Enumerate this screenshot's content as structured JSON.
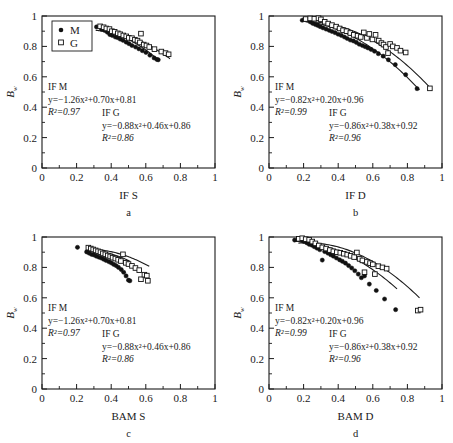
{
  "figure": {
    "y_axis_label_main": "B",
    "y_axis_label_sub": "w",
    "legend": {
      "items": [
        {
          "key": "M",
          "marker": "filled-circle"
        },
        {
          "key": "G",
          "marker": "open-square"
        }
      ]
    },
    "axis_ticks": {
      "x": [
        "0",
        "0.2",
        "0.4",
        "0.6",
        "0.8",
        "1"
      ],
      "y": [
        "0",
        "0.2",
        "0.4",
        "0.6",
        "0.8",
        "1"
      ]
    }
  },
  "chart_data": [
    {
      "type": "scatter",
      "panel": "a",
      "caption": "a",
      "xlabel": "IF S",
      "ylabel": "Bw",
      "xlim": [
        0,
        1
      ],
      "ylim": [
        0,
        1
      ],
      "grid": false,
      "legend_position": "top-left",
      "annotations": [
        {
          "title": "IF M",
          "equation": "y=−1.26x²+0.70x+0.81",
          "r2": "R²=0.97"
        },
        {
          "title": "IF G",
          "equation": "y=−0.88x²+0.46x+0.86",
          "r2": "R²=0.86"
        }
      ],
      "series": [
        {
          "name": "M",
          "marker": "filled-circle",
          "fit": {
            "a": -1.26,
            "b": 0.7,
            "c": 0.81,
            "r2": 0.97,
            "xstart": 0.31,
            "xend": 0.67
          },
          "points": [
            [
              0.315,
              0.928
            ],
            [
              0.345,
              0.912
            ],
            [
              0.362,
              0.905
            ],
            [
              0.378,
              0.893
            ],
            [
              0.392,
              0.878
            ],
            [
              0.406,
              0.872
            ],
            [
              0.424,
              0.862
            ],
            [
              0.437,
              0.858
            ],
            [
              0.452,
              0.848
            ],
            [
              0.468,
              0.84
            ],
            [
              0.487,
              0.828
            ],
            [
              0.503,
              0.818
            ],
            [
              0.52,
              0.806
            ],
            [
              0.541,
              0.796
            ],
            [
              0.56,
              0.784
            ],
            [
              0.58,
              0.772
            ],
            [
              0.601,
              0.76
            ],
            [
              0.624,
              0.742
            ],
            [
              0.648,
              0.724
            ],
            [
              0.664,
              0.714
            ],
            [
              0.672,
              0.712
            ]
          ]
        },
        {
          "name": "G",
          "marker": "open-square",
          "fit": {
            "a": -0.88,
            "b": 0.46,
            "c": 0.86,
            "r2": 0.86,
            "xstart": 0.33,
            "xend": 0.74
          },
          "points": [
            [
              0.336,
              0.932
            ],
            [
              0.356,
              0.926
            ],
            [
              0.372,
              0.918
            ],
            [
              0.39,
              0.914
            ],
            [
              0.404,
              0.9
            ],
            [
              0.42,
              0.896
            ],
            [
              0.438,
              0.886
            ],
            [
              0.452,
              0.88
            ],
            [
              0.47,
              0.872
            ],
            [
              0.487,
              0.866
            ],
            [
              0.502,
              0.856
            ],
            [
              0.52,
              0.854
            ],
            [
              0.537,
              0.844
            ],
            [
              0.552,
              0.838
            ],
            [
              0.566,
              0.826
            ],
            [
              0.572,
              0.884
            ],
            [
              0.588,
              0.812
            ],
            [
              0.604,
              0.806
            ],
            [
              0.62,
              0.796
            ],
            [
              0.65,
              0.782
            ],
            [
              0.69,
              0.766
            ],
            [
              0.714,
              0.756
            ],
            [
              0.732,
              0.748
            ]
          ]
        }
      ]
    },
    {
      "type": "scatter",
      "panel": "b",
      "caption": "b",
      "xlabel": "IF D",
      "ylabel": "Bw",
      "xlim": [
        0,
        1
      ],
      "ylim": [
        0,
        1
      ],
      "grid": false,
      "legend_position": "none",
      "annotations": [
        {
          "title": "IF M",
          "equation": "y=−0.82x²+0.20x+0.96",
          "r2": "R²=0.99"
        },
        {
          "title": "IF G",
          "equation": "y=−0.86x²+0.38x+0.92",
          "r2": "R²=0.96"
        }
      ],
      "series": [
        {
          "name": "M",
          "marker": "filled-circle",
          "fit": {
            "a": -0.82,
            "b": 0.2,
            "c": 0.96,
            "r2": 0.99,
            "xstart": 0.19,
            "xend": 0.87
          },
          "points": [
            [
              0.192,
              0.972
            ],
            [
              0.205,
              0.978
            ],
            [
              0.222,
              0.972
            ],
            [
              0.238,
              0.962
            ],
            [
              0.252,
              0.952
            ],
            [
              0.268,
              0.944
            ],
            [
              0.282,
              0.938
            ],
            [
              0.296,
              0.93
            ],
            [
              0.312,
              0.922
            ],
            [
              0.33,
              0.914
            ],
            [
              0.348,
              0.906
            ],
            [
              0.364,
              0.898
            ],
            [
              0.382,
              0.89
            ],
            [
              0.4,
              0.88
            ],
            [
              0.418,
              0.872
            ],
            [
              0.436,
              0.862
            ],
            [
              0.452,
              0.852
            ],
            [
              0.47,
              0.842
            ],
            [
              0.488,
              0.836
            ],
            [
              0.505,
              0.826
            ],
            [
              0.522,
              0.814
            ],
            [
              0.54,
              0.806
            ],
            [
              0.556,
              0.798
            ],
            [
              0.572,
              0.79
            ],
            [
              0.59,
              0.78
            ],
            [
              0.61,
              0.768
            ],
            [
              0.632,
              0.752
            ],
            [
              0.66,
              0.736
            ],
            [
              0.69,
              0.712
            ],
            [
              0.73,
              0.68
            ],
            [
              0.79,
              0.614
            ],
            [
              0.856,
              0.522
            ]
          ]
        },
        {
          "name": "G",
          "marker": "open-square",
          "fit": {
            "a": -0.86,
            "b": 0.38,
            "c": 0.92,
            "r2": 0.96,
            "xstart": 0.21,
            "xend": 0.94
          },
          "points": [
            [
              0.212,
              0.98
            ],
            [
              0.238,
              0.984
            ],
            [
              0.262,
              0.982
            ],
            [
              0.286,
              0.986
            ],
            [
              0.3,
              0.978
            ],
            [
              0.322,
              0.962
            ],
            [
              0.342,
              0.95
            ],
            [
              0.364,
              0.94
            ],
            [
              0.388,
              0.93
            ],
            [
              0.408,
              0.918
            ],
            [
              0.428,
              0.906
            ],
            [
              0.448,
              0.9
            ],
            [
              0.47,
              0.888
            ],
            [
              0.49,
              0.876
            ],
            [
              0.512,
              0.87
            ],
            [
              0.53,
              0.862
            ],
            [
              0.548,
              0.892
            ],
            [
              0.566,
              0.856
            ],
            [
              0.58,
              0.882
            ],
            [
              0.598,
              0.846
            ],
            [
              0.616,
              0.876
            ],
            [
              0.634,
              0.838
            ],
            [
              0.65,
              0.822
            ],
            [
              0.662,
              0.812
            ],
            [
              0.676,
              0.796
            ],
            [
              0.688,
              0.756
            ],
            [
              0.7,
              0.816
            ],
            [
              0.716,
              0.8
            ],
            [
              0.74,
              0.79
            ],
            [
              0.76,
              0.772
            ],
            [
              0.79,
              0.76
            ],
            [
              0.93,
              0.524
            ]
          ]
        }
      ]
    },
    {
      "type": "scatter",
      "panel": "c",
      "caption": "c",
      "xlabel": "BAM S",
      "ylabel": "Bw",
      "xlim": [
        0,
        1
      ],
      "ylim": [
        0,
        1
      ],
      "grid": false,
      "legend_position": "none",
      "annotations": [
        {
          "title": "IF M",
          "equation": "y=−1.26x²+0.70x+0.81",
          "r2": "R²=0.97"
        },
        {
          "title": "IF G",
          "equation": "y=−0.88x²+0.46x+0.86",
          "r2": "R²=0.86"
        }
      ],
      "series": [
        {
          "name": "M",
          "marker": "filled-circle",
          "fit": {
            "a": -1.26,
            "b": 0.7,
            "c": 0.81,
            "r2": 0.97,
            "xstart": 0.25,
            "xend": 0.51
          },
          "points": [
            [
              0.205,
              0.932
            ],
            [
              0.258,
              0.902
            ],
            [
              0.272,
              0.894
            ],
            [
              0.286,
              0.886
            ],
            [
              0.3,
              0.882
            ],
            [
              0.314,
              0.874
            ],
            [
              0.328,
              0.868
            ],
            [
              0.342,
              0.862
            ],
            [
              0.356,
              0.854
            ],
            [
              0.37,
              0.846
            ],
            [
              0.386,
              0.838
            ],
            [
              0.4,
              0.83
            ],
            [
              0.414,
              0.82
            ],
            [
              0.428,
              0.812
            ],
            [
              0.442,
              0.8
            ],
            [
              0.458,
              0.786
            ],
            [
              0.472,
              0.768
            ],
            [
              0.486,
              0.744
            ],
            [
              0.5,
              0.716
            ],
            [
              0.508,
              0.712
            ]
          ]
        },
        {
          "name": "G",
          "marker": "open-square",
          "fit": {
            "a": -0.88,
            "b": 0.46,
            "c": 0.86,
            "r2": 0.86,
            "xstart": 0.27,
            "xend": 0.62
          },
          "points": [
            [
              0.268,
              0.93
            ],
            [
              0.282,
              0.924
            ],
            [
              0.296,
              0.918
            ],
            [
              0.31,
              0.912
            ],
            [
              0.324,
              0.906
            ],
            [
              0.338,
              0.9
            ],
            [
              0.352,
              0.892
            ],
            [
              0.366,
              0.886
            ],
            [
              0.38,
              0.878
            ],
            [
              0.394,
              0.872
            ],
            [
              0.408,
              0.864
            ],
            [
              0.424,
              0.858
            ],
            [
              0.44,
              0.85
            ],
            [
              0.456,
              0.842
            ],
            [
              0.468,
              0.886
            ],
            [
              0.484,
              0.83
            ],
            [
              0.5,
              0.822
            ],
            [
              0.52,
              0.81
            ],
            [
              0.54,
              0.796
            ],
            [
              0.562,
              0.782
            ],
            [
              0.572,
              0.722
            ],
            [
              0.592,
              0.752
            ],
            [
              0.606,
              0.746
            ],
            [
              0.612,
              0.712
            ]
          ]
        }
      ]
    },
    {
      "type": "scatter",
      "panel": "d",
      "caption": "d",
      "xlabel": "BAM D",
      "ylabel": "Bw",
      "xlim": [
        0,
        1
      ],
      "ylim": [
        0,
        1
      ],
      "grid": false,
      "legend_position": "none",
      "annotations": [
        {
          "title": "IF M",
          "equation": "y=−0.82x²+0.20x+0.96",
          "r2": "R²=0.99"
        },
        {
          "title": "IF G",
          "equation": "y=−0.86x²+0.38x+0.92",
          "r2": "R²=0.96"
        }
      ],
      "series": [
        {
          "name": "M",
          "marker": "filled-circle",
          "fit": {
            "a": -0.82,
            "b": 0.2,
            "c": 0.96,
            "r2": 0.99,
            "xstart": 0.15,
            "xend": 0.74
          },
          "points": [
            [
              0.148,
              0.98
            ],
            [
              0.168,
              0.984
            ],
            [
              0.186,
              0.978
            ],
            [
              0.202,
              0.97
            ],
            [
              0.218,
              0.962
            ],
            [
              0.232,
              0.952
            ],
            [
              0.248,
              0.946
            ],
            [
              0.262,
              0.936
            ],
            [
              0.278,
              0.926
            ],
            [
              0.294,
              0.916
            ],
            [
              0.308,
              0.848
            ],
            [
              0.322,
              0.904
            ],
            [
              0.34,
              0.894
            ],
            [
              0.356,
              0.884
            ],
            [
              0.372,
              0.874
            ],
            [
              0.39,
              0.862
            ],
            [
              0.408,
              0.85
            ],
            [
              0.424,
              0.84
            ],
            [
              0.442,
              0.828
            ],
            [
              0.46,
              0.812
            ],
            [
              0.478,
              0.796
            ],
            [
              0.496,
              0.778
            ],
            [
              0.516,
              0.756
            ],
            [
              0.534,
              0.732
            ],
            [
              0.552,
              0.744
            ],
            [
              0.58,
              0.69
            ],
            [
              0.62,
              0.648
            ],
            [
              0.668,
              0.592
            ],
            [
              0.732,
              0.522
            ]
          ]
        },
        {
          "name": "G",
          "marker": "open-square",
          "fit": {
            "a": -0.86,
            "b": 0.38,
            "c": 0.92,
            "r2": 0.96,
            "xstart": 0.17,
            "xend": 0.87
          },
          "points": [
            [
              0.172,
              0.988
            ],
            [
              0.192,
              0.992
            ],
            [
              0.212,
              0.986
            ],
            [
              0.232,
              0.982
            ],
            [
              0.25,
              0.97
            ],
            [
              0.268,
              0.958
            ],
            [
              0.288,
              0.944
            ],
            [
              0.308,
              0.932
            ],
            [
              0.33,
              0.924
            ],
            [
              0.352,
              0.914
            ],
            [
              0.372,
              0.906
            ],
            [
              0.392,
              0.9
            ],
            [
              0.412,
              0.896
            ],
            [
              0.432,
              0.89
            ],
            [
              0.452,
              0.884
            ],
            [
              0.472,
              0.876
            ],
            [
              0.492,
              0.868
            ],
            [
              0.508,
              0.898
            ],
            [
              0.524,
              0.856
            ],
            [
              0.54,
              0.846
            ],
            [
              0.552,
              0.768
            ],
            [
              0.566,
              0.836
            ],
            [
              0.584,
              0.828
            ],
            [
              0.6,
              0.82
            ],
            [
              0.612,
              0.756
            ],
            [
              0.632,
              0.808
            ],
            [
              0.656,
              0.8
            ],
            [
              0.68,
              0.792
            ],
            [
              0.86,
              0.516
            ],
            [
              0.876,
              0.522
            ]
          ]
        }
      ]
    }
  ]
}
